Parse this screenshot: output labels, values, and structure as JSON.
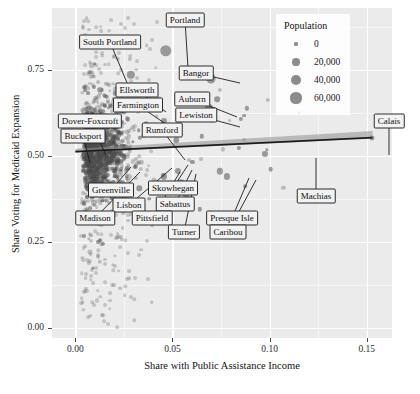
{
  "chart_data": {
    "type": "scatter",
    "title": "",
    "xlabel": "Share with Public Assistance Income",
    "ylabel": "Share Voting for Medicaid Expansion",
    "xlim": [
      -0.012,
      0.163
    ],
    "ylim": [
      -0.03,
      0.93
    ],
    "xticks": [
      "0.00",
      "0.05",
      "0.10",
      "0.15"
    ],
    "xtick_values": [
      0.0,
      0.05,
      0.1,
      0.15
    ],
    "yticks": [
      "0.00",
      "0.25",
      "0.50",
      "0.75"
    ],
    "ytick_values": [
      0.0,
      0.25,
      0.5,
      0.75
    ],
    "grid": true,
    "size_legend": {
      "title": "Population",
      "entries": [
        {
          "label": "0",
          "value": 0
        },
        {
          "label": "20,000",
          "value": 20000
        },
        {
          "label": "40,000",
          "value": 40000
        },
        {
          "label": "60,000",
          "value": 60000
        }
      ],
      "position": "top-right-inside"
    },
    "fit": {
      "type": "linear-regression",
      "x_start": 0.0,
      "y_start": 0.512,
      "x_end": 0.153,
      "y_end": 0.553,
      "band": true
    },
    "labeled_points": [
      {
        "name": "Portland",
        "x": 0.0465,
        "y": 0.805,
        "pop": 66000
      },
      {
        "name": "South Portland",
        "x": 0.0285,
        "y": 0.735,
        "pop": 25000
      },
      {
        "name": "Bangor",
        "x": 0.07,
        "y": 0.725,
        "pop": 33000
      },
      {
        "name": "Ellsworth",
        "x": 0.041,
        "y": 0.655,
        "pop": 8000
      },
      {
        "name": "Farmington",
        "x": 0.0455,
        "y": 0.6,
        "pop": 7800
      },
      {
        "name": "Auburn",
        "x": 0.069,
        "y": 0.64,
        "pop": 23000
      },
      {
        "name": "Lewiston",
        "x": 0.07,
        "y": 0.61,
        "pop": 36000
      },
      {
        "name": "Dover-Foxcroft",
        "x": 0.0225,
        "y": 0.56,
        "pop": 4200
      },
      {
        "name": "Rumford",
        "x": 0.052,
        "y": 0.545,
        "pop": 5800
      },
      {
        "name": "Bucksport",
        "x": 0.019,
        "y": 0.52,
        "pop": 4900
      },
      {
        "name": "Greenville",
        "x": 0.031,
        "y": 0.47,
        "pop": 1600
      },
      {
        "name": "Skowhegan",
        "x": 0.053,
        "y": 0.455,
        "pop": 8600
      },
      {
        "name": "Lisbon",
        "x": 0.0455,
        "y": 0.44,
        "pop": 9000
      },
      {
        "name": "Sabattus",
        "x": 0.0545,
        "y": 0.425,
        "pop": 4900
      },
      {
        "name": "Madison",
        "x": 0.033,
        "y": 0.405,
        "pop": 4800
      },
      {
        "name": "Pittsfield",
        "x": 0.049,
        "y": 0.41,
        "pop": 4200
      },
      {
        "name": "Turner",
        "x": 0.057,
        "y": 0.385,
        "pop": 5700
      },
      {
        "name": "Presque Isle",
        "x": 0.0745,
        "y": 0.455,
        "pop": 9300
      },
      {
        "name": "Caribou",
        "x": 0.078,
        "y": 0.44,
        "pop": 8200
      },
      {
        "name": "Machias",
        "x": 0.1005,
        "y": 0.462,
        "pop": 2200
      },
      {
        "name": "Calais",
        "x": 0.1525,
        "y": 0.552,
        "pop": 3100
      }
    ],
    "callouts": [
      {
        "name": "Portland",
        "box_x": 185,
        "box_y": 20,
        "anchor_x": 188,
        "anchor_y": 68
      },
      {
        "name": "South Portland",
        "box_x": 110,
        "box_y": 42,
        "anchor_x": 130,
        "anchor_y": 90
      },
      {
        "name": "Bangor",
        "box_x": 196,
        "box_y": 73,
        "anchor_x": 240,
        "anchor_y": 83
      },
      {
        "name": "Ellsworth",
        "box_x": 137,
        "box_y": 90,
        "anchor_x": 166,
        "anchor_y": 112
      },
      {
        "name": "Farmington",
        "box_x": 138,
        "box_y": 105,
        "anchor_x": 176,
        "anchor_y": 131
      },
      {
        "name": "Auburn",
        "box_x": 192,
        "box_y": 99,
        "anchor_x": 237,
        "anchor_y": 117
      },
      {
        "name": "Lewiston",
        "box_x": 196,
        "box_y": 115,
        "anchor_x": 240,
        "anchor_y": 127
      },
      {
        "name": "Dover-Foxcroft",
        "box_x": 90,
        "box_y": 121,
        "anchor_x": 106,
        "anchor_y": 155
      },
      {
        "name": "Rumford",
        "box_x": 162,
        "box_y": 130,
        "anchor_x": 185,
        "anchor_y": 160
      },
      {
        "name": "Bucksport",
        "box_x": 83,
        "box_y": 136,
        "anchor_x": 90,
        "anchor_y": 163
      },
      {
        "name": "Greenville",
        "box_x": 111,
        "box_y": 190,
        "anchor_x": 131,
        "anchor_y": 167
      },
      {
        "name": "Skowhegan",
        "box_x": 173,
        "box_y": 188,
        "anchor_x": 188,
        "anchor_y": 165
      },
      {
        "name": "Lisbon",
        "box_x": 129,
        "box_y": 205,
        "anchor_x": 172,
        "anchor_y": 168
      },
      {
        "name": "Sabattus",
        "box_x": 175,
        "box_y": 204,
        "anchor_x": 192,
        "anchor_y": 170
      },
      {
        "name": "Madison",
        "box_x": 95,
        "box_y": 218,
        "anchor_x": 140,
        "anchor_y": 172
      },
      {
        "name": "Pittsfield",
        "box_x": 152,
        "box_y": 218,
        "anchor_x": 180,
        "anchor_y": 172
      },
      {
        "name": "Turner",
        "box_x": 184,
        "box_y": 232,
        "anchor_x": 196,
        "anchor_y": 174
      },
      {
        "name": "Presque Isle",
        "box_x": 232,
        "box_y": 218,
        "anchor_x": 249,
        "anchor_y": 178
      },
      {
        "name": "Caribou",
        "box_x": 228,
        "box_y": 232,
        "anchor_x": 256,
        "anchor_y": 180
      },
      {
        "name": "Machias",
        "box_x": 316,
        "box_y": 196,
        "anchor_x": 316,
        "anchor_y": 158
      },
      {
        "name": "Calais",
        "box_x": 389,
        "box_y": 121,
        "anchor_x": 389,
        "anchor_y": 155
      }
    ]
  }
}
